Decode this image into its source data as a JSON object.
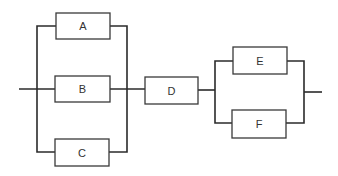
{
  "diagram": {
    "type": "reliability-block-diagram",
    "blocks": [
      {
        "id": "A",
        "label": "A"
      },
      {
        "id": "B",
        "label": "B"
      },
      {
        "id": "C",
        "label": "C"
      },
      {
        "id": "D",
        "label": "D"
      },
      {
        "id": "E",
        "label": "E"
      },
      {
        "id": "F",
        "label": "F"
      }
    ],
    "structure": [
      {
        "kind": "parallel",
        "members": [
          "A",
          "B",
          "C"
        ]
      },
      {
        "kind": "series",
        "members": [
          "D"
        ]
      },
      {
        "kind": "parallel",
        "members": [
          "E",
          "F"
        ]
      }
    ],
    "colors": {
      "line": "#2b2b2b",
      "box_stroke": "#3a3a3a",
      "text": "#333333",
      "background": "#ffffff"
    }
  }
}
